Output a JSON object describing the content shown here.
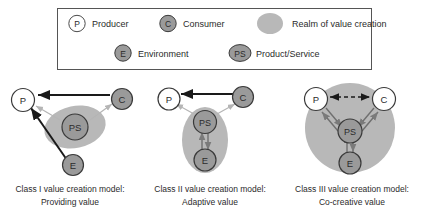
{
  "figure": {
    "legend": {
      "items": [
        {
          "id": "producer",
          "symbol": "P",
          "label": "Producer",
          "shape": "circle-white"
        },
        {
          "id": "consumer",
          "symbol": "C",
          "label": "Consumer",
          "shape": "circle-gray"
        },
        {
          "id": "realm",
          "symbol": "",
          "label": "Realm of value creation",
          "shape": "blob-lightgray"
        },
        {
          "id": "environment",
          "symbol": "E",
          "label": "Environment",
          "shape": "circle-gray"
        },
        {
          "id": "product",
          "symbol": "PS",
          "label": "Product/Service",
          "shape": "ellipse-gray"
        }
      ]
    },
    "panels": [
      {
        "id": "class-1",
        "caption_line1": "Class I value creation model:",
        "caption_line2": "Providing value",
        "nodes": [
          {
            "id": "p",
            "symbol": "P"
          },
          {
            "id": "c",
            "symbol": "C"
          },
          {
            "id": "ps",
            "symbol": "PS"
          },
          {
            "id": "e",
            "symbol": "E"
          }
        ],
        "edges": [
          {
            "from": "c",
            "to": "p",
            "style": "solid-thick-black",
            "heads": "one"
          },
          {
            "from": "e",
            "to": "p",
            "style": "solid-thick-black",
            "heads": "one"
          },
          {
            "from": "ps",
            "to": "p",
            "style": "solid-thin-gray",
            "heads": "one"
          },
          {
            "from": "ps",
            "to": "c",
            "style": "solid-thin-gray",
            "heads": "one"
          }
        ]
      },
      {
        "id": "class-2",
        "caption_line1": "Class II value creation model:",
        "caption_line2": "Adaptive value",
        "nodes": [
          {
            "id": "p",
            "symbol": "P"
          },
          {
            "id": "c",
            "symbol": "C"
          },
          {
            "id": "ps",
            "symbol": "PS"
          },
          {
            "id": "e",
            "symbol": "E"
          }
        ],
        "edges": [
          {
            "from": "c",
            "to": "p",
            "style": "solid-thick-black",
            "heads": "one"
          },
          {
            "from": "ps",
            "to": "p",
            "style": "solid-thin-gray",
            "heads": "one"
          },
          {
            "from": "ps",
            "to": "c",
            "style": "solid-thin-gray",
            "heads": "one"
          },
          {
            "from": "ps",
            "to": "e",
            "style": "solid-gray",
            "heads": "both"
          }
        ]
      },
      {
        "id": "class-3",
        "caption_line1": "Class III value creation model:",
        "caption_line2": "Co-creative value",
        "nodes": [
          {
            "id": "p",
            "symbol": "P"
          },
          {
            "id": "c",
            "symbol": "C"
          },
          {
            "id": "ps",
            "symbol": "PS"
          },
          {
            "id": "e",
            "symbol": "E"
          }
        ],
        "edges": [
          {
            "from": "p",
            "to": "c",
            "style": "dashed-black",
            "heads": "both"
          },
          {
            "from": "p",
            "to": "ps",
            "style": "solid-gray",
            "heads": "both"
          },
          {
            "from": "c",
            "to": "ps",
            "style": "solid-gray",
            "heads": "both"
          },
          {
            "from": "ps",
            "to": "e",
            "style": "solid-gray",
            "heads": "both"
          }
        ]
      }
    ],
    "colors": {
      "realm_fill": "#b8b8b8",
      "node_gray_fill": "#9a9a9a",
      "node_white_fill": "#ffffff",
      "stroke_dark": "#1a1a1a",
      "stroke_gray": "#7a7a7a",
      "stroke_light": "#c9c9c9",
      "legend_border": "#555555",
      "text": "#2b2b2b"
    }
  }
}
